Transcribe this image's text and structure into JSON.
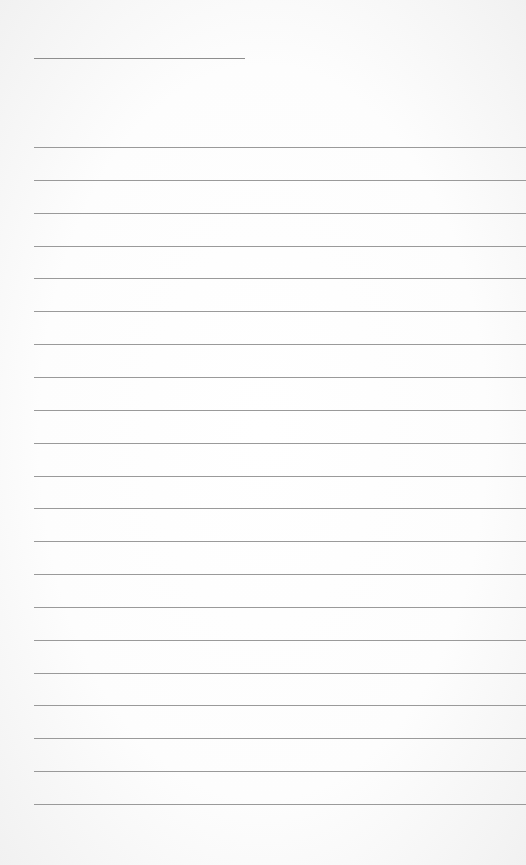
{
  "page": {
    "type": "lined-paper",
    "title_line": {
      "text": ""
    },
    "ruled_lines": {
      "count": 21,
      "first_y": 147,
      "spacing": 32.85,
      "color": "#9a9a9a"
    },
    "entries": []
  }
}
